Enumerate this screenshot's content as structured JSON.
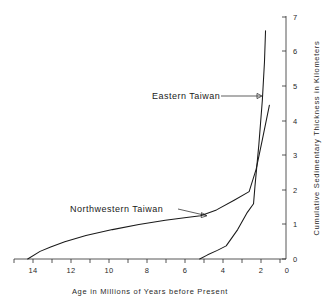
{
  "chart_data": {
    "type": "line",
    "title": "",
    "xlabel": "Age in Millions of Years before Present",
    "ylabel": "Cumulative Sedimentary Thickness in Kilometers",
    "xlim": [
      15,
      0
    ],
    "ylim": [
      0,
      7
    ],
    "x_reversed": true,
    "y_axis_position": "right",
    "grid": false,
    "legend_position": "inline-annotations",
    "x_ticks": [
      14,
      13,
      12,
      11,
      10,
      9,
      8,
      7,
      6,
      5,
      4,
      3,
      2,
      1,
      0
    ],
    "x_tick_labels": [
      "14",
      "",
      "12",
      "",
      "10",
      "",
      "8",
      "",
      "6",
      "",
      "4",
      "",
      "2",
      "",
      "0"
    ],
    "x_tick_labels_shown": [
      "14",
      "12",
      "10",
      "8",
      "6",
      "4",
      "2",
      "0"
    ],
    "y_ticks": [
      0,
      1,
      2,
      3,
      4,
      5,
      6,
      7
    ],
    "y_tick_labels": [
      "0",
      "1",
      "2",
      "3",
      "4",
      "5",
      "6",
      "7"
    ],
    "series": [
      {
        "name": "Northwestern Taiwan",
        "label": "Northwestern Taiwan",
        "color": "#1a1a1a",
        "points": [
          [
            14.3,
            0.0
          ],
          [
            13.6,
            0.22
          ],
          [
            13.0,
            0.35
          ],
          [
            12.2,
            0.5
          ],
          [
            11.0,
            0.68
          ],
          [
            9.5,
            0.85
          ],
          [
            8.0,
            1.0
          ],
          [
            6.5,
            1.12
          ],
          [
            5.3,
            1.2
          ],
          [
            4.5,
            1.25
          ],
          [
            3.6,
            1.42
          ],
          [
            2.6,
            1.7
          ],
          [
            1.75,
            1.95
          ],
          [
            1.35,
            2.6
          ],
          [
            1.0,
            3.45
          ],
          [
            0.6,
            4.45
          ]
        ]
      },
      {
        "name": "Eastern Taiwan",
        "label": "Eastern Taiwan",
        "color": "#1a1a1a",
        "points": [
          [
            4.55,
            0.0
          ],
          [
            4.1,
            0.12
          ],
          [
            3.55,
            0.25
          ],
          [
            3.05,
            0.38
          ],
          [
            2.4,
            0.85
          ],
          [
            1.85,
            1.35
          ],
          [
            1.5,
            1.6
          ],
          [
            1.42,
            2.1
          ],
          [
            1.2,
            3.3
          ],
          [
            1.0,
            4.6
          ],
          [
            0.88,
            5.7
          ],
          [
            0.82,
            6.6
          ]
        ]
      }
    ],
    "annotations": [
      {
        "name": "eastern-taiwan-annotation",
        "text": "Eastern Taiwan",
        "text_x_px": 152,
        "text_y_px": 99,
        "arrow_from_px": [
          221,
          96
        ],
        "arrow_to_px": [
          262,
          96
        ]
      },
      {
        "name": "northwestern-taiwan-annotation",
        "text": "Northwestern Taiwan",
        "text_x_px": 70,
        "text_y_px": 212,
        "arrow_from_px": [
          178,
          209
        ],
        "arrow_to_px": [
          207,
          216
        ]
      }
    ]
  }
}
